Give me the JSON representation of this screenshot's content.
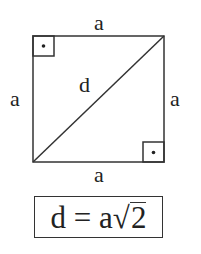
{
  "diagram": {
    "labels": {
      "top_side": "a",
      "left_side": "a",
      "right_side": "a",
      "bottom_side": "a",
      "diagonal": "d"
    },
    "right_angle_markers": [
      "top-left",
      "bottom-right"
    ],
    "colors": {
      "stroke": "#333333",
      "background": "#ffffff"
    }
  },
  "formula": {
    "lhs": "d",
    "equals": "=",
    "coef": "a",
    "radical_symbol": "√",
    "radicand": "2"
  }
}
